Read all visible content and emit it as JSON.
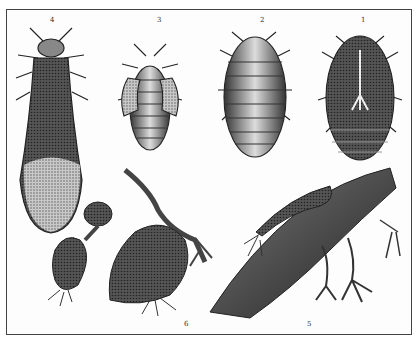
{
  "plate": {
    "figures": [
      {
        "id": "fig-1",
        "label": "1",
        "subject": "insect ventral view"
      },
      {
        "id": "fig-2",
        "label": "2",
        "subject": "insect dorsal view"
      },
      {
        "id": "fig-3",
        "label": "3",
        "subject": "nymph with wing pads"
      },
      {
        "id": "fig-4",
        "label": "4",
        "subject": "winged insect"
      },
      {
        "id": "fig-5",
        "label": "5",
        "subject": "root with galls"
      },
      {
        "id": "fig-6",
        "label": "6",
        "subject": "swollen root nodules"
      }
    ],
    "colors": {
      "ink": "#222222",
      "paper": "#fdfdfd",
      "border": "#444444"
    }
  }
}
